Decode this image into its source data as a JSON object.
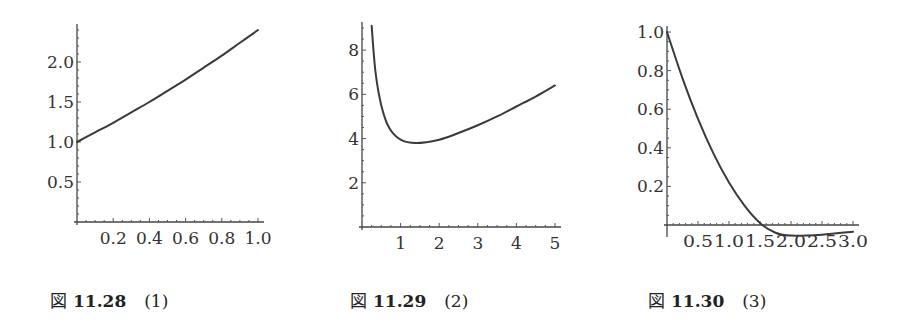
{
  "chart_data": [
    {
      "type": "line",
      "id": "fig-11-28",
      "caption": {
        "fig": "図",
        "number": "11.28",
        "label": "(1)"
      },
      "x_ticks": [
        "0.2",
        "0.4",
        "0.6",
        "0.8",
        "1.0"
      ],
      "y_ticks": [
        "0.5",
        "1.0",
        "1.5",
        "2.0"
      ],
      "xlim": [
        0,
        1.0
      ],
      "ylim": [
        0,
        2.4
      ],
      "x": [
        0,
        0.1,
        0.2,
        0.3,
        0.4,
        0.5,
        0.6,
        0.7,
        0.8,
        0.9,
        1.0
      ],
      "y": [
        1.0,
        1.12,
        1.24,
        1.37,
        1.5,
        1.64,
        1.78,
        1.93,
        2.08,
        2.24,
        2.4
      ],
      "grid": false
    },
    {
      "type": "line",
      "id": "fig-11-29",
      "caption": {
        "fig": "図",
        "number": "11.29",
        "label": "(2)"
      },
      "x_ticks": [
        "1",
        "2",
        "3",
        "4",
        "5"
      ],
      "y_ticks": [
        "2",
        "4",
        "6",
        "8"
      ],
      "xlim": [
        0,
        5
      ],
      "ylim": [
        0,
        9
      ],
      "x": [
        0.25,
        0.35,
        0.5,
        0.7,
        1.0,
        1.4,
        2.0,
        2.5,
        3.0,
        3.5,
        4.0,
        4.5,
        5.0
      ],
      "y": [
        9.1,
        7.0,
        5.5,
        4.5,
        3.95,
        3.8,
        3.95,
        4.25,
        4.6,
        5.0,
        5.45,
        5.9,
        6.4
      ],
      "grid": false
    },
    {
      "type": "line",
      "id": "fig-11-30",
      "caption": {
        "fig": "図",
        "number": "11.30",
        "label": "(3)"
      },
      "x_ticks": [
        "0.5",
        "1.0",
        "1.5",
        "2.0",
        "2.5",
        "3.0"
      ],
      "y_ticks": [
        "0.2",
        "0.4",
        "0.6",
        "0.8",
        "1.0"
      ],
      "xlim": [
        0,
        3.0
      ],
      "ylim": [
        -0.05,
        1.0
      ],
      "x": [
        0,
        0.25,
        0.5,
        0.75,
        1.0,
        1.25,
        1.5,
        1.75,
        2.0,
        2.5,
        3.0
      ],
      "y": [
        1.0,
        0.76,
        0.55,
        0.37,
        0.22,
        0.1,
        0.01,
        -0.04,
        -0.055,
        -0.05,
        -0.035
      ],
      "grid": false
    }
  ]
}
